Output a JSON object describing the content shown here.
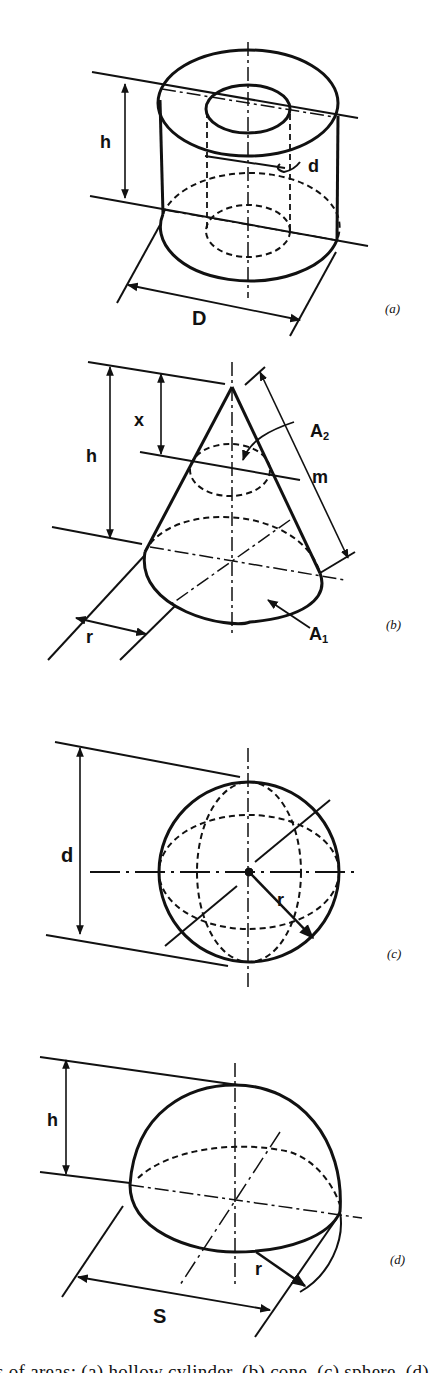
{
  "figures": [
    {
      "id": "a",
      "tag": "(a)",
      "shape": "hollow cylinder",
      "labels": {
        "height": "h",
        "inner_diameter": "d",
        "outer_diameter": "D"
      }
    },
    {
      "id": "b",
      "tag": "(b)",
      "shape": "cone",
      "labels": {
        "height": "h",
        "section_height": "x",
        "slant": "m",
        "section_area": "A",
        "section_area_sub": "2",
        "base_area": "A",
        "base_area_sub": "1",
        "radius": "r"
      }
    },
    {
      "id": "c",
      "tag": "(c)",
      "shape": "sphere",
      "labels": {
        "diameter": "d",
        "radius": "r"
      }
    },
    {
      "id": "d",
      "tag": "(d)",
      "shape": "spherical segment",
      "labels": {
        "height": "h",
        "chord": "S",
        "radius": "r"
      }
    }
  ],
  "caption": "s of areas: (a) hollow cylinder, (b) cone, (c) sphere, (d) spherical segment"
}
